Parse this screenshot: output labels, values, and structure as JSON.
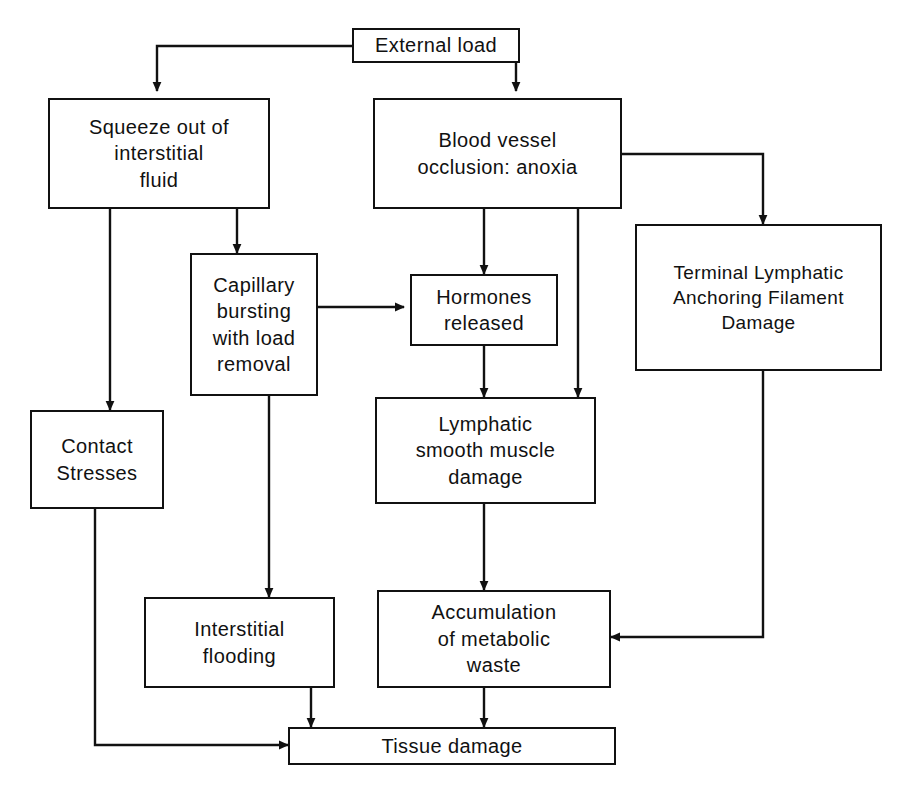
{
  "diagram": {
    "type": "flowchart",
    "background_color": "#ffffff",
    "line_color": "#111111",
    "text_color": "#111111",
    "nodes": [
      {
        "id": "external_load",
        "label": "External load"
      },
      {
        "id": "squeeze_fluid",
        "label": "Squeeze out of\ninterstitial\nfluid"
      },
      {
        "id": "blood_occlusion",
        "label": "Blood vessel\nocclusion: anoxia"
      },
      {
        "id": "capillary_bursting",
        "label": "Capillary\nbursting\nwith  load\nremoval"
      },
      {
        "id": "hormones_released",
        "label": "Hormones\nreleased"
      },
      {
        "id": "terminal_lymphatic",
        "label": "Terminal  Lymphatic\nAnchoring  Filament\nDamage"
      },
      {
        "id": "contact_stresses",
        "label": "Contact\nStresses"
      },
      {
        "id": "lymphatic_damage",
        "label": "Lymphatic\nsmooth  muscle\ndamage"
      },
      {
        "id": "interstitial_flooding",
        "label": "Interstitial\nflooding"
      },
      {
        "id": "metabolic_waste",
        "label": "Accumulation\nof  metabolic\nwaste"
      },
      {
        "id": "tissue_damage",
        "label": "Tissue  damage"
      }
    ],
    "edges": [
      {
        "from": "external_load",
        "to": "squeeze_fluid"
      },
      {
        "from": "external_load",
        "to": "blood_occlusion"
      },
      {
        "from": "squeeze_fluid",
        "to": "capillary_bursting"
      },
      {
        "from": "squeeze_fluid",
        "to": "contact_stresses"
      },
      {
        "from": "blood_occlusion",
        "to": "hormones_released"
      },
      {
        "from": "blood_occlusion",
        "to": "lymphatic_damage"
      },
      {
        "from": "blood_occlusion",
        "to": "terminal_lymphatic"
      },
      {
        "from": "capillary_bursting",
        "to": "hormones_released"
      },
      {
        "from": "capillary_bursting",
        "to": "interstitial_flooding"
      },
      {
        "from": "hormones_released",
        "to": "lymphatic_damage"
      },
      {
        "from": "lymphatic_damage",
        "to": "metabolic_waste"
      },
      {
        "from": "terminal_lymphatic",
        "to": "metabolic_waste"
      },
      {
        "from": "contact_stresses",
        "to": "tissue_damage"
      },
      {
        "from": "interstitial_flooding",
        "to": "tissue_damage"
      },
      {
        "from": "metabolic_waste",
        "to": "tissue_damage"
      }
    ]
  }
}
